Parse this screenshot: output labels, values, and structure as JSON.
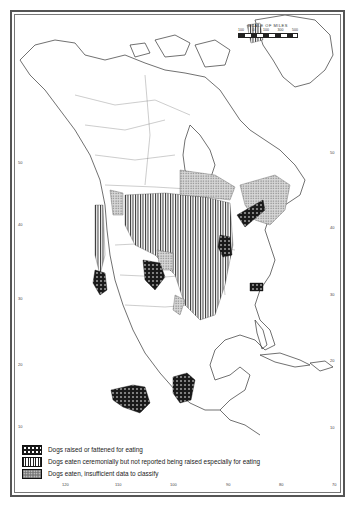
{
  "map": {
    "title": "Distribution of dog eating in North America",
    "scale": {
      "title": "SCALE OF MILES",
      "ticks": [
        "100",
        "0",
        "100",
        "300",
        "500"
      ]
    },
    "latitude_labels_left": [
      "60",
      "50",
      "40",
      "30",
      "20",
      "10"
    ],
    "latitude_labels_right": [
      "50",
      "40",
      "30",
      "20",
      "10"
    ],
    "longitude_labels_bottom": [
      "120",
      "110",
      "100",
      "90",
      "80",
      "70"
    ],
    "longitude_labels_top": [
      "160",
      "150",
      "140",
      "130",
      "120",
      "110",
      "100",
      "90",
      "80",
      "70",
      "60",
      "50"
    ],
    "regions": {
      "raised_or_fattened": [
        "California central valley",
        "Great Basin / Colorado Plateau (Ute region)",
        "Great Lakes (Huron/Iroquois)",
        "St. Lawrence valley",
        "Southeast (Carolina coast)",
        "Central Mexico",
        "Yucatán peninsula"
      ],
      "ceremonial": [
        "Great Plains",
        "Mississippi valley",
        "Northwest Coast",
        "Northern Greenland fringe"
      ],
      "insufficient_data": [
        "Northern Great Lakes/Subarctic band",
        "Eastern Canada / Maritimes",
        "Parts of Southwest",
        "Plateau region"
      ]
    }
  },
  "legend": {
    "items": [
      {
        "pattern": "black-dots",
        "label": "Dogs raised or fattened for eating"
      },
      {
        "pattern": "vertical-lines",
        "label": "Dogs eaten ceremonially but not reported being raised especially for eating"
      },
      {
        "pattern": "stipple",
        "label": "Dogs eaten, insufficient data to classify"
      }
    ]
  },
  "colors": {
    "ink": "#222222",
    "paper": "#ffffff",
    "stipple": "#777777"
  }
}
